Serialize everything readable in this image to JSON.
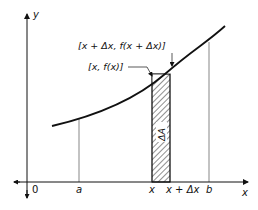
{
  "diagram": {
    "type": "area-under-curve-strip",
    "axes": {
      "x_label": "x",
      "y_label": "y",
      "origin_label": "0"
    },
    "x_ticks": [
      {
        "id": "a",
        "label": "a"
      },
      {
        "id": "x",
        "label": "x"
      },
      {
        "id": "x_plus_dx",
        "label": "x + Δx"
      },
      {
        "id": "b",
        "label": "b"
      }
    ],
    "annotations": {
      "point_right": "[x + Δx, f(x + Δx)]",
      "point_left": "[x, f(x)]",
      "strip_label": "ΔA"
    },
    "colors": {
      "line": "#111111",
      "background": "#ffffff",
      "hatch": "#222222"
    }
  }
}
